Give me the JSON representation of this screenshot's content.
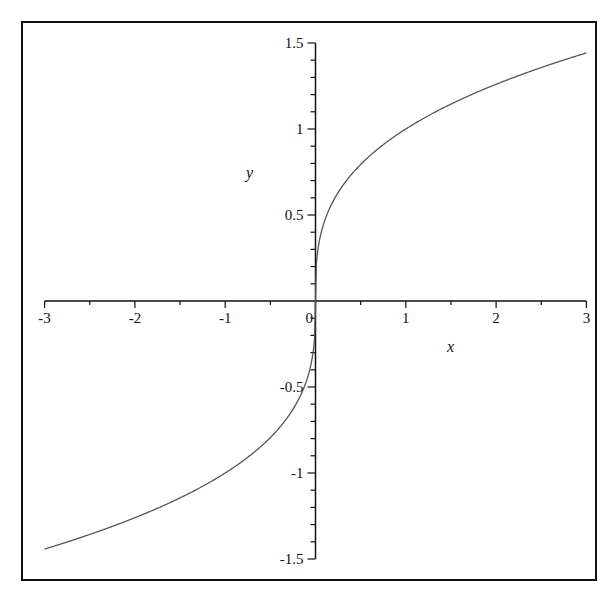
{
  "chart_data": {
    "type": "line",
    "title": "",
    "function": "y = x^(1/3)",
    "xlabel": "x",
    "ylabel": "y",
    "xlim": [
      -3,
      3
    ],
    "ylim": [
      -1.5,
      1.5
    ],
    "grid": false,
    "legend": null,
    "x_ticks": {
      "major": [
        -3,
        -2,
        -1,
        0,
        1,
        2,
        3
      ],
      "labels": [
        "-3",
        "-2",
        "-1",
        "0",
        "1",
        "2",
        "3"
      ],
      "minor_step": 0.5
    },
    "y_ticks": {
      "major": [
        -1.5,
        -1,
        -0.5,
        0.5,
        1,
        1.5
      ],
      "labels": [
        "-1.5",
        "-1",
        "-0.5",
        "0.5",
        "1",
        "1.5"
      ],
      "minor_step": 0.1
    },
    "series": [
      {
        "name": "x^(1/3)",
        "color": "#555555",
        "x": [
          -3,
          -2.5,
          -2,
          -1.5,
          -1,
          -0.5,
          -0.25,
          -0.1,
          -0.01,
          0,
          0.01,
          0.1,
          0.25,
          0.5,
          1,
          1.5,
          2,
          2.5,
          3
        ],
        "y": [
          -1.442,
          -1.357,
          -1.26,
          -1.145,
          -1,
          -0.794,
          -0.63,
          -0.464,
          -0.215,
          0,
          0.215,
          0.464,
          0.63,
          0.794,
          1,
          1.145,
          1.26,
          1.357,
          1.442
        ]
      }
    ]
  },
  "colors": {
    "frame": "#111111",
    "axes": "#111111",
    "curve": "#555555",
    "background": "#ffffff"
  }
}
